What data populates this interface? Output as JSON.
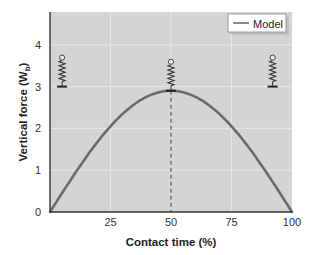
{
  "chart_data": {
    "type": "line",
    "title": "",
    "xlabel": "Contact time (%)",
    "ylabel_main": "Vertical force (W",
    "ylabel_sub": "b",
    "ylabel_close": ")",
    "xlim": [
      0,
      100
    ],
    "ylim": [
      0,
      4.8
    ],
    "xticks": [
      25,
      50,
      75,
      100
    ],
    "yticks": [
      0,
      1,
      2,
      3,
      4
    ],
    "grid": true,
    "legend_position": "upper right",
    "series": [
      {
        "name": "Model",
        "x": [
          0,
          10,
          20,
          25,
          30,
          40,
          50,
          60,
          70,
          75,
          80,
          90,
          100
        ],
        "values": [
          0,
          0.9,
          1.72,
          2.05,
          2.35,
          2.76,
          2.9,
          2.76,
          2.35,
          2.05,
          1.72,
          0.9,
          0
        ],
        "color": "#6b6b6b"
      }
    ],
    "annotations": [
      {
        "type": "vline",
        "x": 50,
        "style": "dashed",
        "color": "#555555"
      },
      {
        "type": "spring-icon",
        "x": 5,
        "y": 3
      },
      {
        "type": "spring-icon",
        "x": 50,
        "y": 2.9
      },
      {
        "type": "spring-icon",
        "x": 92,
        "y": 3
      }
    ],
    "plot_background": "#d4d4d4",
    "gridline_color": "#e6e6e6"
  },
  "legend": {
    "label": "Model"
  },
  "axes": {
    "x_ticks": [
      "0",
      "25",
      "50",
      "75",
      "100"
    ],
    "y_ticks": [
      "0",
      "1",
      "2",
      "3",
      "4"
    ]
  }
}
